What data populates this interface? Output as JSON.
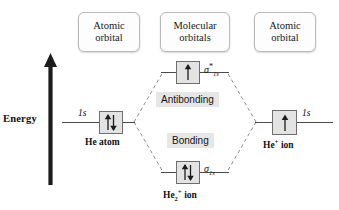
{
  "diagram": {
    "title_absent": true,
    "energy_axis": {
      "label": "Energy",
      "direction": "up",
      "icon": "up-arrow-icon"
    },
    "headers": [
      {
        "line1": "Atomic",
        "line2": "orbital"
      },
      {
        "line1": "Molecular",
        "line2": "orbitals"
      },
      {
        "line1": "Atomic",
        "line2": "orbital"
      }
    ],
    "left_atom": {
      "orbital_label": "1s",
      "species": "He atom",
      "electrons": "two-paired-arrows",
      "electron_count": 2
    },
    "right_atom": {
      "orbital_label": "1s",
      "species_html": "He<sup>+</sup> ion",
      "species_text": "He+ ion",
      "electrons": "single-up-arrow",
      "electron_count": 1
    },
    "molecule": {
      "species_html": "He<sub>2</sub><sup>+</sup> ion",
      "species_text": "He2+ ion"
    },
    "molecular_orbitals": [
      {
        "name": "antibonding",
        "region_label": "Antibonding",
        "sigma_html": "&sigma;<sup>*</sup><sub>1s</sub>",
        "sigma_text": "sigma*1s",
        "electrons": "single-up-arrow",
        "electron_count": 1
      },
      {
        "name": "bonding",
        "region_label": "Bonding",
        "sigma_html": "&sigma;<sub>1s</sub>",
        "sigma_text": "sigma1s",
        "electrons": "two-paired-arrows",
        "electron_count": 2
      }
    ],
    "colors": {
      "orbital_box_fill": "#e3e3e3",
      "orbital_box_border": "#6f6f6f",
      "region_label_fill": "#e6e6e6",
      "energy_arrow": "#1c1c1c",
      "dashed_line": "#8d8d8d",
      "level_line": "#4a4a4a",
      "header_border": "#b9b9b9",
      "background": "#ffffff"
    }
  }
}
